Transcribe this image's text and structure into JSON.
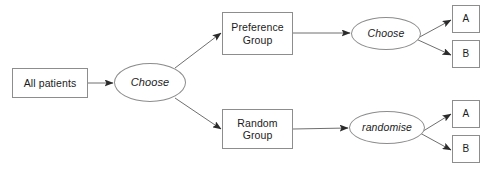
{
  "diagram": {
    "type": "flowchart",
    "background_color": "#ffffff",
    "line_color": "#6f6f6f",
    "text_color": "#1b1b1b",
    "nodes": {
      "all_patients": {
        "label": "All patients",
        "shape": "rectangle"
      },
      "choose_main": {
        "label": "Choose",
        "shape": "ellipse",
        "style": "italic"
      },
      "preference_group": {
        "label": "Preference\nGroup",
        "shape": "rectangle"
      },
      "random_group": {
        "label": "Random\nGroup",
        "shape": "rectangle"
      },
      "choose_top": {
        "label": "Choose",
        "shape": "ellipse",
        "style": "italic"
      },
      "randomise_bottom": {
        "label": "randomise",
        "shape": "ellipse",
        "style": "italic"
      },
      "outcome_top_a": {
        "label": "A",
        "shape": "rectangle"
      },
      "outcome_top_b": {
        "label": "B",
        "shape": "rectangle"
      },
      "outcome_bottom_a": {
        "label": "A",
        "shape": "rectangle"
      },
      "outcome_bottom_b": {
        "label": "B",
        "shape": "rectangle"
      }
    },
    "edges": [
      {
        "from": "all_patients",
        "to": "choose_main",
        "style": "straight-horizontal",
        "arrowhead": true
      },
      {
        "from": "choose_main",
        "to": "preference_group",
        "style": "diagonal-up",
        "arrowhead": true
      },
      {
        "from": "choose_main",
        "to": "random_group",
        "style": "diagonal-down",
        "arrowhead": true
      },
      {
        "from": "preference_group",
        "to": "choose_top",
        "style": "straight-horizontal",
        "arrowhead": true
      },
      {
        "from": "random_group",
        "to": "randomise_bottom",
        "style": "straight-horizontal",
        "arrowhead": true
      },
      {
        "from": "choose_top",
        "to": "outcome_top_a",
        "style": "diagonal-up",
        "arrowhead": true
      },
      {
        "from": "choose_top",
        "to": "outcome_top_b",
        "style": "diagonal-down",
        "arrowhead": true
      },
      {
        "from": "randomise_bottom",
        "to": "outcome_bottom_a",
        "style": "diagonal-up",
        "arrowhead": true
      },
      {
        "from": "randomise_bottom",
        "to": "outcome_bottom_b",
        "style": "diagonal-down",
        "arrowhead": true
      }
    ]
  }
}
